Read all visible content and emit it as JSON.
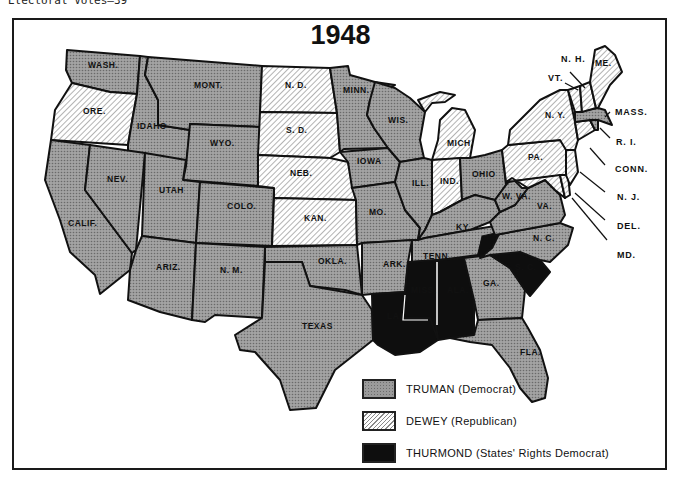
{
  "header": {
    "caption": "Electoral Votes—39"
  },
  "map": {
    "title": "1948",
    "colors": {
      "truman": "#9a9a9a",
      "dewey": "#ffffff",
      "thurmond": "#0e0e0e",
      "border": "#111111"
    },
    "states": {
      "wash": {
        "label": "WASH.",
        "winner": "Truman"
      },
      "ore": {
        "label": "ORE.",
        "winner": "Dewey"
      },
      "calif": {
        "label": "CALIF.",
        "winner": "Truman"
      },
      "idaho": {
        "label": "IDAHO",
        "winner": "Truman"
      },
      "nev": {
        "label": "NEV.",
        "winner": "Truman"
      },
      "mont": {
        "label": "MONT.",
        "winner": "Truman"
      },
      "wyo": {
        "label": "WYO.",
        "winner": "Truman"
      },
      "utah": {
        "label": "UTAH",
        "winner": "Truman"
      },
      "ariz": {
        "label": "ARIZ.",
        "winner": "Truman"
      },
      "colo": {
        "label": "COLO.",
        "winner": "Truman"
      },
      "nm": {
        "label": "N. M.",
        "winner": "Truman"
      },
      "nd": {
        "label": "N. D.",
        "winner": "Dewey"
      },
      "sd": {
        "label": "S. D.",
        "winner": "Dewey"
      },
      "neb": {
        "label": "NEB.",
        "winner": "Dewey"
      },
      "kan": {
        "label": "KAN.",
        "winner": "Dewey"
      },
      "okla": {
        "label": "OKLA.",
        "winner": "Truman"
      },
      "texas": {
        "label": "TEXAS",
        "winner": "Truman"
      },
      "minn": {
        "label": "MINN.",
        "winner": "Truman"
      },
      "iowa": {
        "label": "IOWA",
        "winner": "Truman"
      },
      "mo": {
        "label": "MO.",
        "winner": "Truman"
      },
      "ark": {
        "label": "ARK.",
        "winner": "Truman"
      },
      "la": {
        "label": "LA.",
        "winner": "Thurmond"
      },
      "wis": {
        "label": "WIS.",
        "winner": "Truman"
      },
      "ill": {
        "label": "ILL.",
        "winner": "Truman"
      },
      "mich": {
        "label": "MICH.",
        "winner": "Dewey"
      },
      "ind": {
        "label": "IND.",
        "winner": "Dewey"
      },
      "ohio": {
        "label": "OHIO",
        "winner": "Truman"
      },
      "ky": {
        "label": "KY.",
        "winner": "Truman"
      },
      "tenn": {
        "label": "TENN.",
        "winner": "Truman"
      },
      "miss": {
        "label": "MISS.",
        "winner": "Thurmond"
      },
      "ala": {
        "label": "ALA.",
        "winner": "Thurmond"
      },
      "ga": {
        "label": "GA.",
        "winner": "Truman"
      },
      "fla": {
        "label": "FLA.",
        "winner": "Truman"
      },
      "sc": {
        "label": "S. C.",
        "winner": "Thurmond"
      },
      "nc": {
        "label": "N. C.",
        "winner": "Truman"
      },
      "va": {
        "label": "VA.",
        "winner": "Truman"
      },
      "wva": {
        "label": "W. VA.",
        "winner": "Truman"
      },
      "pa": {
        "label": "PA.",
        "winner": "Dewey"
      },
      "ny": {
        "label": "N. Y.",
        "winner": "Dewey"
      },
      "vt": {
        "label": "VT.",
        "winner": "Dewey"
      },
      "nh": {
        "label": "N. H.",
        "winner": "Dewey"
      },
      "me": {
        "label": "ME.",
        "winner": "Dewey"
      },
      "mass": {
        "label": "MASS.",
        "winner": "Truman"
      },
      "ri": {
        "label": "R. I.",
        "winner": "Truman"
      },
      "conn": {
        "label": "CONN.",
        "winner": "Dewey"
      },
      "nj": {
        "label": "N. J.",
        "winner": "Dewey"
      },
      "del": {
        "label": "DEL.",
        "winner": "Dewey"
      },
      "md": {
        "label": "MD.",
        "winner": "Dewey"
      }
    }
  },
  "legend": {
    "items": [
      {
        "label": "TRUMAN (Democrat)",
        "pattern": "dotted-gray"
      },
      {
        "label": "DEWEY (Republican)",
        "pattern": "diagonal-hatch"
      },
      {
        "label": "THURMOND (States' Rights Democrat)",
        "pattern": "solid-black"
      }
    ]
  }
}
